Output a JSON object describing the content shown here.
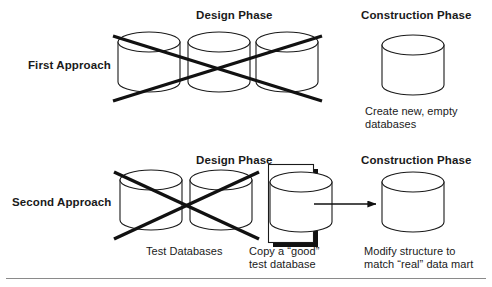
{
  "figure": {
    "column_headers": {
      "design_phase": "Design Phase",
      "construction_phase": "Construction Phase"
    },
    "rows": [
      {
        "id": "first-approach",
        "label": "First Approach",
        "design": {
          "cylinder_count": 3,
          "crossed_out": true,
          "caption": ""
        },
        "construction": {
          "cylinder_count": 1,
          "crossed_out": false,
          "caption": "Create new, empty\ndatabases",
          "caption_line1": "Create new, empty",
          "caption_line2": "databases"
        },
        "arrow": false
      },
      {
        "id": "second-approach",
        "label": "Second Approach",
        "design": {
          "cylinder_count": 2,
          "crossed_out": true,
          "caption": "Test Databases"
        },
        "selected": {
          "cylinder_count": 1,
          "boxed": true,
          "shadow": true,
          "caption_line1": "Copy a “good”",
          "caption_line2": "test database"
        },
        "construction": {
          "cylinder_count": 1,
          "crossed_out": false,
          "caption_line1": "Modify structure to",
          "caption_line2": "match “real” data mart"
        },
        "arrow": true
      }
    ],
    "colors": {
      "ink": "#111111",
      "stroke": "#1a1a1a",
      "background": "#ffffff",
      "shadow": "#111111",
      "rule": "#8a8a8a"
    },
    "icons": {
      "database_cylinder": "database-cylinder-icon",
      "cross_out": "cross-out-x-icon",
      "flow_arrow": "flow-arrow-right-icon",
      "shadow_box": "shadow-box-icon",
      "bottom_rule": "horizontal-rule"
    }
  }
}
